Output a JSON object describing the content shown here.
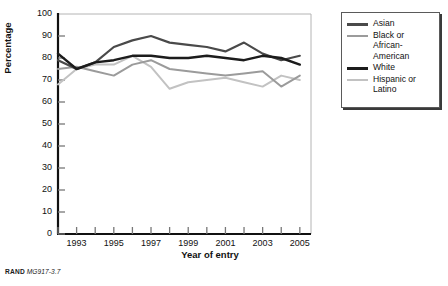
{
  "figure": {
    "footer_brand": "RAND",
    "footer_code": "MG917-3.7"
  },
  "chart_data": {
    "type": "line",
    "title": "",
    "xlabel": "Year of entry",
    "ylabel": "Percentage",
    "xlim": [
      1992,
      2005.6
    ],
    "ylim": [
      0,
      100
    ],
    "grid": false,
    "legend_position": "right",
    "x": [
      1992,
      1993,
      1994,
      1995,
      1996,
      1997,
      1998,
      1999,
      2000,
      2001,
      2002,
      2003,
      2004,
      2005
    ],
    "xticks": [
      1992,
      1993,
      1994,
      1995,
      1996,
      1997,
      1998,
      1999,
      2000,
      2001,
      2002,
      2003,
      2004,
      2005
    ],
    "xtick_labels": [
      "",
      "1993",
      "",
      "1995",
      "",
      "1997",
      "",
      "1999",
      "",
      "2001",
      "",
      "2003",
      "",
      "2005"
    ],
    "yticks": [
      0,
      10,
      20,
      30,
      40,
      50,
      60,
      70,
      80,
      90,
      100
    ],
    "ytick_labels": [
      "0",
      "10",
      "20",
      "30",
      "40",
      "50",
      "60",
      "70",
      "80",
      "90",
      "100"
    ],
    "series": [
      {
        "name": "Asian",
        "color": "#4a4a4a",
        "width": 2.2,
        "values": [
          79,
          75,
          78,
          85,
          88,
          90,
          87,
          86,
          85,
          83,
          87,
          82,
          79,
          81
        ]
      },
      {
        "name": "Black or African-American",
        "color": "#9b9b9b",
        "width": 2.0,
        "values": [
          75,
          76,
          74,
          72,
          77,
          79,
          75,
          74,
          73,
          72,
          73,
          74,
          67,
          72
        ]
      },
      {
        "name": "White",
        "color": "#1c1c1c",
        "width": 2.4,
        "values": [
          82,
          75,
          78,
          79,
          81,
          81,
          80,
          80,
          81,
          80,
          79,
          81,
          80,
          77
        ]
      },
      {
        "name": "Hispanic or Latino",
        "color": "#c2c2c2",
        "width": 2.0,
        "values": [
          68,
          75,
          77,
          77,
          81,
          76,
          66,
          69,
          70,
          71,
          69,
          67,
          72,
          70
        ]
      }
    ]
  },
  "legend": {
    "items": [
      {
        "label": "Asian",
        "color": "#4a4a4a"
      },
      {
        "label": "Black or\nAfrican-\nAmerican",
        "color": "#9b9b9b"
      },
      {
        "label": "White",
        "color": "#1c1c1c"
      },
      {
        "label": "Hispanic or\nLatino",
        "color": "#c2c2c2"
      }
    ]
  }
}
